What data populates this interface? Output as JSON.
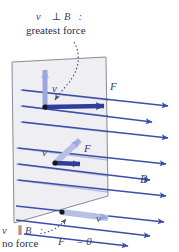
{
  "figure": {
    "width": 179,
    "height": 252
  },
  "colors": {
    "field_arrow": "#3b4fa8",
    "force_arrow": "#2e3f99",
    "velocity_arrow": "#9aa8dd",
    "velocity_arrow_dark": "#2e3f99",
    "plane_fill": "#e9e7ee",
    "plane_stroke": "#8a8a94",
    "label_text": "#3a3f6b",
    "leader_line": "#4a4f7a",
    "dot": "#15161e",
    "background": "#ffffff"
  },
  "annotations": {
    "top_label_line1": "v⃗ ⊥ B⃗:",
    "top_label_line2": "greatest force",
    "bottom_label_line1": "v⃗ ∥ B⃗:",
    "bottom_label_line2": "no force",
    "zero_force_equation": "F⃗ = 0⃗"
  },
  "vector_labels": {
    "velocity_top": "v⃗",
    "force_top": "F⃗",
    "velocity_middle": "v⃗",
    "force_middle": "F⃗",
    "velocity_bottom": "v⃗",
    "field": "B⃗"
  },
  "field_lines": {
    "count": 9,
    "direction": "right-and-slightly-down",
    "description": "Uniform magnetic field B pointing to the right, drawn as parallel arrows in perspective"
  },
  "cases": [
    {
      "id": "perpendicular",
      "position": "top",
      "velocity_direction": "up (in plane, perpendicular to B)",
      "force_direction": "right-ish (largest magnitude)",
      "note": "greatest force"
    },
    {
      "id": "oblique",
      "position": "middle",
      "velocity_direction": "up-right at an angle to B",
      "force_direction": "right-ish (smaller magnitude)",
      "note": "intermediate force"
    },
    {
      "id": "parallel",
      "position": "bottom",
      "velocity_direction": "parallel to B",
      "force_direction": "zero",
      "note": "no force"
    }
  ]
}
